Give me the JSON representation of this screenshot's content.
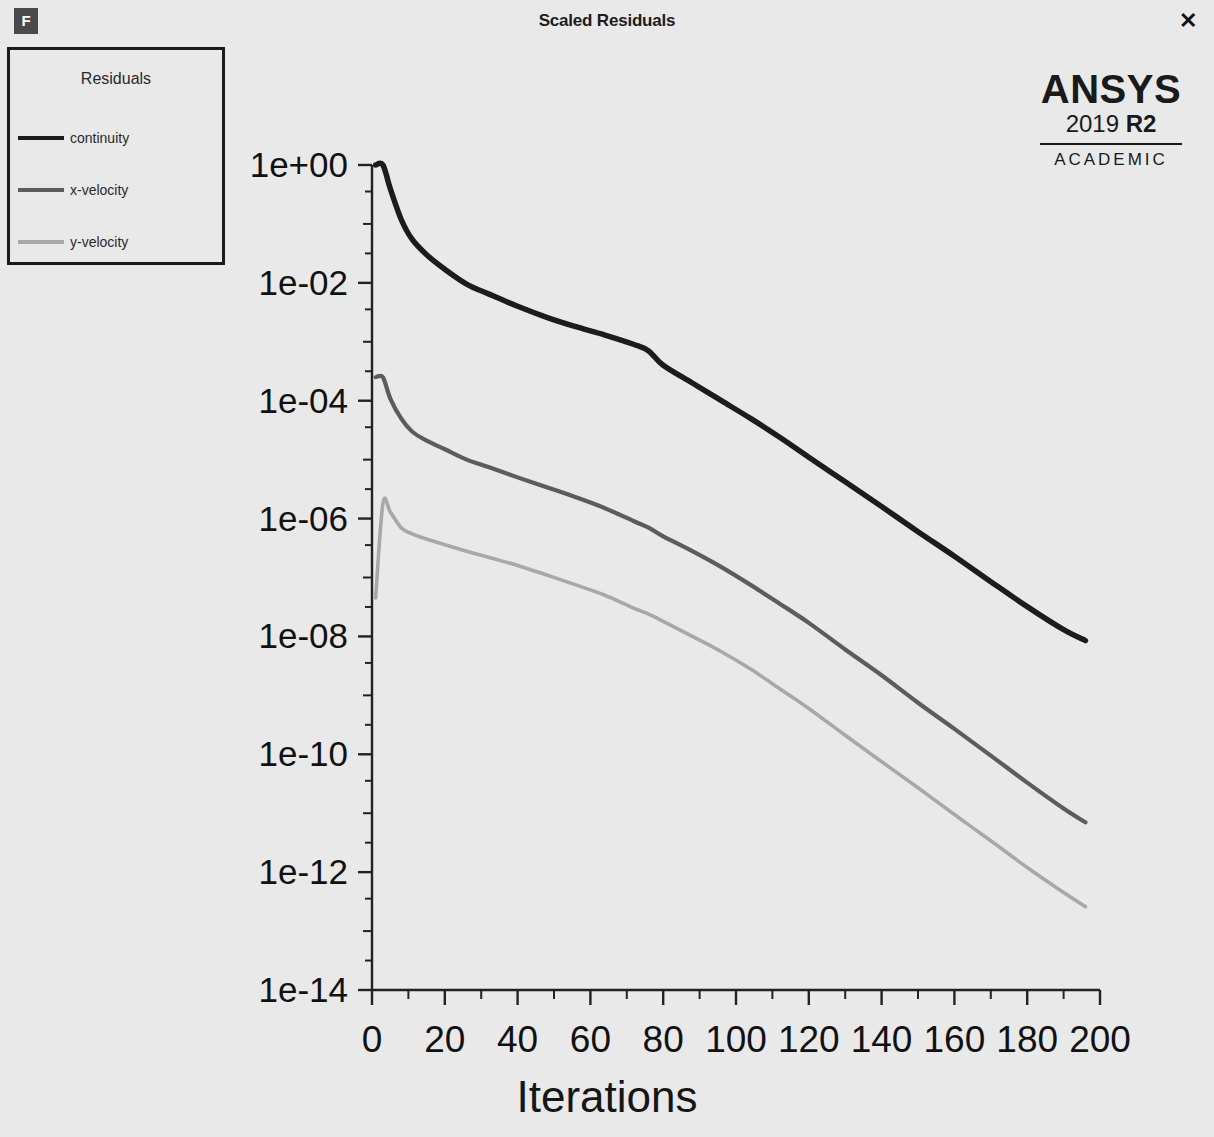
{
  "window": {
    "title": "Scaled Residuals",
    "app_icon": "F",
    "close_icon": "✕"
  },
  "legend": {
    "title": "Residuals",
    "items": [
      {
        "label": "continuity",
        "color": "#1c1c1c"
      },
      {
        "label": "x-velocity",
        "color": "#5c5c5c"
      },
      {
        "label": "y-velocity",
        "color": "#a8a8a8"
      }
    ]
  },
  "branding": {
    "wordmark": "ANSYS",
    "version_year": "2019 ",
    "version_release": "R2",
    "license": "ACADEMIC"
  },
  "chart_data": {
    "type": "line",
    "title": "Scaled Residuals",
    "xlabel": "Iterations",
    "ylabel": "",
    "xlim": [
      0,
      200
    ],
    "ylim": [
      1e-14,
      1
    ],
    "yscale": "log",
    "grid": false,
    "legend_position": "top-left",
    "xticks": [
      0,
      20,
      40,
      60,
      80,
      100,
      120,
      140,
      160,
      180,
      200
    ],
    "xticklabels": [
      "0",
      "20",
      "40",
      "60",
      "80",
      "100",
      "120",
      "140",
      "160",
      "180",
      "200"
    ],
    "yticks": [
      1,
      0.01,
      0.0001,
      1e-06,
      1e-08,
      1e-10,
      1e-12,
      1e-14
    ],
    "yticklabels": [
      "1e+00",
      "1e-02",
      "1e-04",
      "1e-06",
      "1e-08",
      "1e-10",
      "1e-12",
      "1e-14"
    ],
    "x": [
      1,
      3,
      5,
      8,
      11,
      15,
      20,
      26,
      32,
      40,
      48,
      56,
      64,
      72,
      76,
      80,
      88,
      96,
      104,
      112,
      120,
      130,
      140,
      150,
      160,
      170,
      180,
      190,
      196
    ],
    "series": [
      {
        "name": "continuity",
        "color": "#1c1c1c",
        "values": [
          1.0,
          1.0,
          0.4,
          0.12,
          0.055,
          0.03,
          0.017,
          0.0095,
          0.0065,
          0.004,
          0.0026,
          0.0018,
          0.0013,
          0.0009,
          0.0007,
          0.0004,
          0.0002,
          0.0001,
          5e-05,
          2.4e-05,
          1.1e-05,
          4.2e-06,
          1.6e-06,
          6e-07,
          2.3e-07,
          8.5e-08,
          3.2e-08,
          1.3e-08,
          8.5e-09
        ]
      },
      {
        "name": "x-velocity",
        "color": "#5c5c5c",
        "values": [
          0.00025,
          0.00025,
          0.00011,
          5e-05,
          3e-05,
          2.1e-05,
          1.5e-05,
          1e-05,
          7.5e-06,
          5e-06,
          3.4e-06,
          2.3e-06,
          1.5e-06,
          9e-07,
          7e-07,
          5e-07,
          2.8e-07,
          1.5e-07,
          7.5e-08,
          3.6e-08,
          1.7e-08,
          6e-09,
          2.2e-09,
          7.5e-10,
          2.7e-10,
          9.5e-11,
          3.3e-11,
          1.2e-11,
          7e-12
        ]
      },
      {
        "name": "y-velocity",
        "color": "#a8a8a8",
        "values": [
          4.5e-08,
          1.8e-06,
          1.3e-06,
          7e-07,
          5.5e-07,
          4.5e-07,
          3.6e-07,
          2.8e-07,
          2.2e-07,
          1.6e-07,
          1.1e-07,
          7.5e-08,
          5e-08,
          3e-08,
          2.4e-08,
          1.8e-08,
          1e-08,
          5.5e-09,
          2.8e-09,
          1.3e-09,
          6e-10,
          2.1e-10,
          7.5e-11,
          2.7e-11,
          9.5e-12,
          3.4e-12,
          1.2e-12,
          4.5e-13,
          2.6e-13
        ]
      }
    ]
  }
}
